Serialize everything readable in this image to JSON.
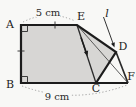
{
  "figure": {
    "point_labels": {
      "a": "A",
      "b": "B",
      "c": "C",
      "d": "D",
      "e": "E",
      "f": "F"
    },
    "line_label": "l",
    "dimensions": {
      "top_width": "5 cm",
      "bottom_width": "9 cm"
    },
    "colors": {
      "shade": "#d7d6d4",
      "line": "#1c1c1c",
      "thin_line": "#4a4a4a",
      "dotted_arc": "#9c9c9c",
      "background": "#f8f8f6"
    }
  }
}
